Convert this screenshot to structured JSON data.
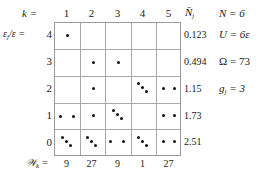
{
  "header": {
    "k_label": "k =",
    "columns": [
      "1",
      "2",
      "3",
      "4",
      "5"
    ],
    "nbar_label": "N̄",
    "nbar_sub": "j"
  },
  "rows_axis": {
    "label": "ε",
    "label_sub": "j",
    "label_rest": "/ε =",
    "rows": [
      "4",
      "3",
      "2",
      "1",
      "0"
    ]
  },
  "nbar_values": [
    "0.123",
    "0.494",
    "1.15",
    "1.73",
    "2.51"
  ],
  "footer": {
    "w_label": "𝒲",
    "w_sub": "k",
    "w_eq": "=",
    "w_values": [
      "9",
      "27",
      "9",
      "1",
      "27"
    ]
  },
  "side": {
    "n": "N = 6",
    "u": "U = 6ε",
    "omega": "Ω = 73",
    "g_main": "g",
    "g_sub": "j",
    "g_rest": " = 3"
  },
  "cells": {
    "description": "number of dots per cell [row energy 4..0][column k 1..5]",
    "counts": [
      [
        1,
        0,
        0,
        0,
        0
      ],
      [
        0,
        1,
        1,
        0,
        0
      ],
      [
        0,
        1,
        0,
        3,
        2
      ],
      [
        2,
        1,
        3,
        0,
        2
      ],
      [
        3,
        3,
        2,
        3,
        2
      ]
    ]
  }
}
